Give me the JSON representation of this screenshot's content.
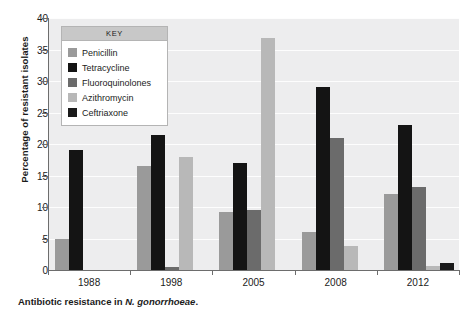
{
  "chart_data": {
    "type": "bar",
    "title": "",
    "xlabel": "",
    "ylabel": "Percentage of resistant isolates",
    "ylim": [
      0,
      40
    ],
    "yticks": [
      0,
      5,
      10,
      15,
      20,
      25,
      30,
      35,
      40
    ],
    "grid": true,
    "legend_position": "inside-top-left",
    "legend_title": "KEY",
    "categories": [
      "1988",
      "1998",
      "2005",
      "2008",
      "2012"
    ],
    "series": [
      {
        "name": "Penicillin",
        "color": "#9a9a9a",
        "values": [
          5.0,
          16.5,
          9.2,
          6.0,
          12.0
        ]
      },
      {
        "name": "Tetracycline",
        "color": "#141414",
        "values": [
          19.0,
          21.5,
          17.0,
          29.0,
          23.0
        ]
      },
      {
        "name": "Fluoroquinolones",
        "color": "#6b6b6b",
        "values": [
          0,
          0.4,
          9.5,
          21.0,
          13.2
        ]
      },
      {
        "name": "Azithromycin",
        "color": "#b8b8b8",
        "values": [
          0,
          18.0,
          36.8,
          3.8,
          0.6
        ]
      },
      {
        "name": "Ceftriaxone",
        "color": "#1a1a1a",
        "values": [
          0,
          0,
          0,
          0,
          1.1
        ]
      }
    ]
  },
  "caption": {
    "prefix": "Antibiotic resistance in ",
    "species": "N. gonorrhoeae",
    "suffix": "."
  }
}
